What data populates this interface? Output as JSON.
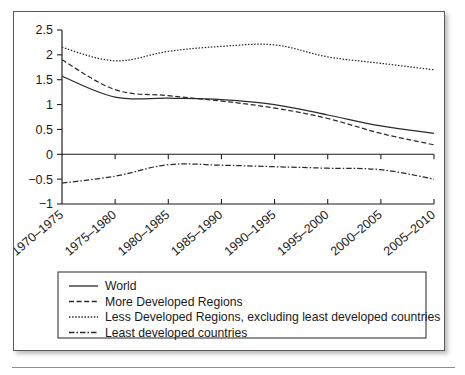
{
  "figure": {
    "frame_border_color": "#5a5a5a",
    "background_color": "#ffffff",
    "line_color": "#2b2b2b"
  },
  "chart_data": {
    "type": "line",
    "title": "",
    "xlabel": "",
    "ylabel": "",
    "categories": [
      "1970–1975",
      "1975–1980",
      "1980–1985",
      "1985–1990",
      "1990–1995",
      "1995–2000",
      "2000–2005",
      "2005–2010"
    ],
    "ylim": [
      -1,
      2.5
    ],
    "yticks": [
      -1,
      -0.5,
      0,
      0.5,
      1,
      1.5,
      2,
      2.5
    ],
    "ytick_labels": [
      "−1",
      "−0.5",
      "0",
      "0.5",
      "1",
      "1.5",
      "2",
      "2.5"
    ],
    "grid": false,
    "legend_position": "below",
    "zero_line": true,
    "series": [
      {
        "name": "World",
        "dash": "solid",
        "values": [
          1.57,
          1.15,
          1.13,
          1.1,
          1.0,
          0.79,
          0.57,
          0.42
        ]
      },
      {
        "name": "More Developed Regions",
        "dash": "dashed",
        "values": [
          1.9,
          1.3,
          1.18,
          1.07,
          0.93,
          0.72,
          0.42,
          0.19
        ]
      },
      {
        "name": "Less Developed Regions, excluding least developed countries",
        "dash": "dotted",
        "values": [
          2.15,
          1.88,
          2.07,
          2.17,
          2.2,
          1.96,
          1.83,
          1.7
        ]
      },
      {
        "name": "Least developed countries",
        "dash": "dashdot",
        "values": [
          -0.58,
          -0.44,
          -0.21,
          -0.22,
          -0.25,
          -0.28,
          -0.31,
          -0.5
        ]
      }
    ]
  },
  "legend": {
    "items": [
      {
        "label": "World",
        "dash": "solid"
      },
      {
        "label": "More Developed Regions",
        "dash": "dashed"
      },
      {
        "label": "Less Developed Regions, excluding least developed countries",
        "dash": "dotted"
      },
      {
        "label": "Least developed countries",
        "dash": "dashdot"
      }
    ]
  }
}
